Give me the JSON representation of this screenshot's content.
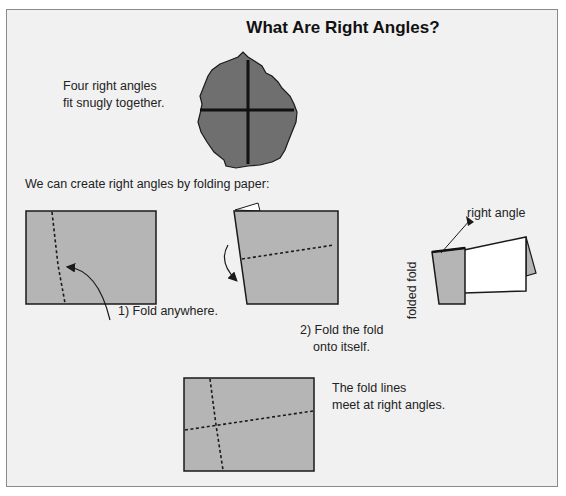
{
  "title": "What Are Right Angles?",
  "intro": {
    "line1": "Four right angles",
    "line2": "fit snugly together."
  },
  "subtitle": "We can create right angles by folding paper:",
  "steps": [
    {
      "label": "1) Fold anywhere."
    },
    {
      "line1": "2) Fold the fold",
      "line2": "onto itself."
    }
  ],
  "figure3": {
    "label_right_angle": "right angle",
    "label_fold": "fold",
    "label_folded_fold": "folded fold"
  },
  "conclusion": {
    "line1": "The fold lines",
    "line2": "meet at right angles."
  },
  "colors": {
    "paper_gray": "#b5b5b5",
    "blob_gray": "#6f6f6f",
    "background": "#f1f1f1",
    "outline": "#1a1a1a"
  }
}
